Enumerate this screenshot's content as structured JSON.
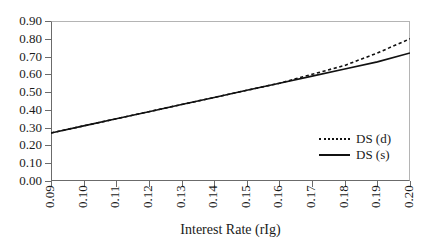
{
  "chart_data": {
    "type": "line",
    "title": "",
    "xlabel": "Interest Rate (rIg)",
    "ylabel": "",
    "xlim": [
      0.09,
      0.2
    ],
    "ylim": [
      0.0,
      0.9
    ],
    "grid": false,
    "legend_position": "inside-right",
    "x_ticks": [
      "0.09",
      "0.10",
      "0.11",
      "0.12",
      "0.13",
      "0.14",
      "0.15",
      "0.16",
      "0.17",
      "0.18",
      "0.19",
      "0.20"
    ],
    "y_ticks": [
      "0.90",
      "0.80",
      "0.70",
      "0.60",
      "0.50",
      "0.40",
      "0.30",
      "0.20",
      "0.10",
      "0.00"
    ],
    "x": [
      0.09,
      0.1,
      0.11,
      0.12,
      0.13,
      0.14,
      0.15,
      0.16,
      0.17,
      0.18,
      0.19,
      0.2
    ],
    "series": [
      {
        "name": "DS (d)",
        "style": "dashed",
        "color": "#111111",
        "values": [
          0.27,
          0.31,
          0.35,
          0.39,
          0.43,
          0.47,
          0.51,
          0.55,
          0.6,
          0.65,
          0.72,
          0.8
        ]
      },
      {
        "name": "DS (s)",
        "style": "solid",
        "color": "#111111",
        "values": [
          0.27,
          0.31,
          0.35,
          0.39,
          0.43,
          0.47,
          0.51,
          0.55,
          0.59,
          0.63,
          0.67,
          0.72
        ]
      }
    ]
  },
  "legend": {
    "items": [
      {
        "label": "DS (d)"
      },
      {
        "label": "DS (s)"
      }
    ]
  }
}
